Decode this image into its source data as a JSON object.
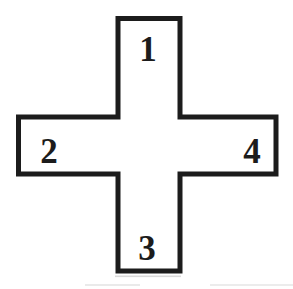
{
  "figure": {
    "type": "cross-diagram",
    "arm_labels": {
      "top": "1",
      "left": "2",
      "bottom": "3",
      "right": "4"
    },
    "colors": {
      "outline": "#1c1c1c",
      "fill": "#ffffff",
      "label_text": "#1c1c1c",
      "background": "#ffffff",
      "scan_artifact": "#b9b9b9"
    }
  }
}
